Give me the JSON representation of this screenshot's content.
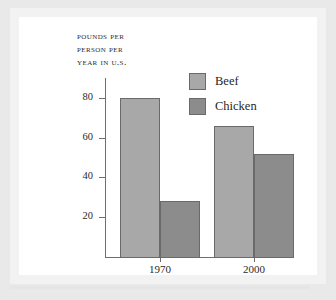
{
  "figure": {
    "title_lines": [
      "Pounds per",
      "person per",
      "year in U.S."
    ]
  },
  "legend": {
    "position": "top-right",
    "entries": [
      {
        "label": "Beef",
        "color": "#a8a8a8",
        "swatch_name": "legend-swatch-beef"
      },
      {
        "label": "Chicken",
        "color": "#8c8c8c",
        "swatch_name": "legend-swatch-chicken"
      }
    ]
  },
  "axes": {
    "y_ticks": [
      "20",
      "40",
      "60",
      "80"
    ],
    "x_labels": [
      "1970",
      "2000"
    ]
  },
  "chart_data": {
    "type": "bar",
    "title": "Pounds per person per year in U.S.",
    "xlabel": "",
    "ylabel": "Pounds per person per year in U.S.",
    "categories": [
      "1970",
      "2000"
    ],
    "series": [
      {
        "name": "Beef",
        "color": "#a8a8a8",
        "values": [
          80,
          66
        ]
      },
      {
        "name": "Chicken",
        "color": "#8c8c8c",
        "values": [
          28,
          52
        ]
      }
    ],
    "ylim": [
      0,
      90
    ],
    "yticks": [
      20,
      40,
      60,
      80
    ],
    "grid": false,
    "legend_position": "top-right"
  }
}
